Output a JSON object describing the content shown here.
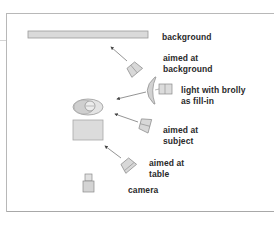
{
  "diagram": {
    "elements": {
      "background": {
        "label": "background"
      },
      "light_background": {
        "line1": "aimed at",
        "line2": "background"
      },
      "brolly": {
        "line1": "light with brolly",
        "line2": "as fill-in"
      },
      "light_subject": {
        "line1": "aimed at",
        "line2": "subject"
      },
      "light_table": {
        "line1": "aimed at",
        "line2": "table"
      },
      "camera": {
        "label": "camera"
      }
    },
    "colors": {
      "fill_light": "#dcdcdc",
      "fill_mid": "#c8c8c8",
      "stroke": "#8a8a8a",
      "arrow": "#555555",
      "text": "#2a2a2a",
      "frame": "#b8b8b8"
    }
  }
}
